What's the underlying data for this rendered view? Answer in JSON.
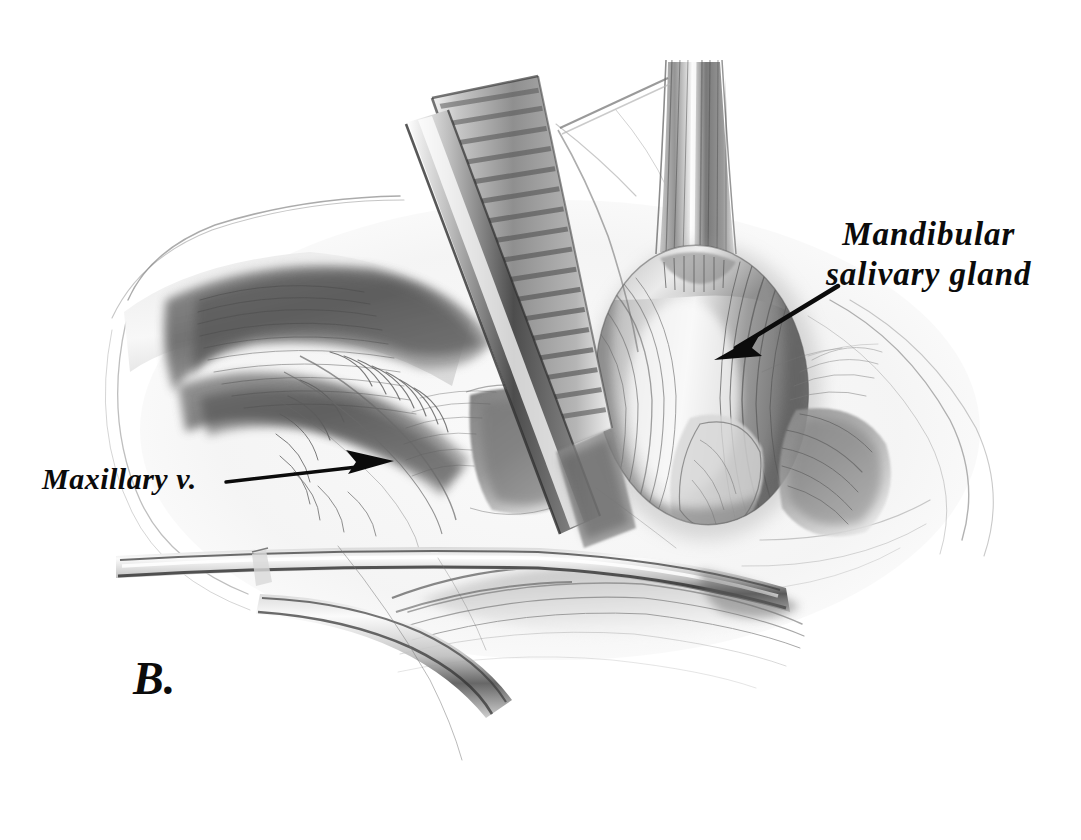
{
  "figure": {
    "panel_letter": "B.",
    "background_color": "#ffffff",
    "ink_color": "#0b0b0b",
    "graphite_color": "#5a5a5a",
    "medium": "pencil-drawing",
    "width": 1081,
    "height": 840
  },
  "labels": [
    {
      "id": "mandibular-salivary-gland",
      "line1": "Mandibular",
      "line2": "salivary gland",
      "full_text": "Mandibular salivary gland"
    },
    {
      "id": "maxillary-vein",
      "line1": "Maxillary v.",
      "full_text": "Maxillary v."
    }
  ],
  "leaders": [
    {
      "id": "mandibular-arrow",
      "style": "arrow",
      "from": [
        838,
        286
      ],
      "to": [
        714,
        360
      ],
      "points_at": "mandibular-salivary-gland"
    },
    {
      "id": "maxillary-arrow",
      "style": "arrow",
      "from": [
        226,
        482
      ],
      "to": [
        394,
        461
      ],
      "points_at": "maxillary-vein"
    }
  ],
  "structures": [
    {
      "id": "mandibular-salivary-gland",
      "kind": "gland",
      "description": "ovoid lobulated gland, right of center"
    },
    {
      "id": "maxillary-vein",
      "kind": "vessel",
      "description": "vein in left tissue bed"
    },
    {
      "id": "retracted-skin-flap",
      "kind": "tissue",
      "description": "retracted flap with shaded crease, upper left"
    },
    {
      "id": "vessel-trunk",
      "kind": "vessel",
      "description": "vertical striated trunk above gland"
    },
    {
      "id": "wound-margin",
      "kind": "tissue",
      "description": "outer skin margin contours"
    }
  ],
  "instruments": [
    {
      "id": "army-navy-retractor",
      "kind": "retractor",
      "description": "serrated blade retractor, center, angled down-right"
    },
    {
      "id": "hemostat-forceps",
      "kind": "forceps",
      "description": "long slender forceps crossing lower field"
    },
    {
      "id": "probe",
      "kind": "probe",
      "description": "thin probe upper right of retractor"
    }
  ]
}
